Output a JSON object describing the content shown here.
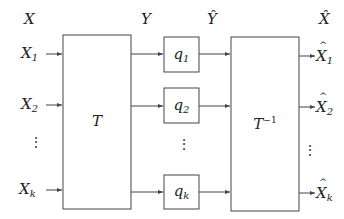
{
  "diagram": {
    "type": "block-diagram",
    "column_headers": {
      "input": "X",
      "transform_output": "Y",
      "quantized": "Ŷ",
      "output": "X̂"
    },
    "inputs": [
      {
        "base": "X",
        "sub": "1"
      },
      {
        "base": "X",
        "sub": "2"
      },
      {
        "base": "X",
        "sub": "k"
      }
    ],
    "transform_block": {
      "label": "T"
    },
    "quantizers": [
      {
        "base": "q",
        "sub": "1"
      },
      {
        "base": "q",
        "sub": "2"
      },
      {
        "base": "q",
        "sub": "k"
      }
    ],
    "inverse_transform_block": {
      "base": "T",
      "sup": "−1"
    },
    "outputs": [
      {
        "base": "X",
        "sub": "1"
      },
      {
        "base": "X",
        "sub": "2"
      },
      {
        "base": "X",
        "sub": "k"
      }
    ],
    "ellipsis": "⋮",
    "colors": {
      "line": "#444444",
      "background": "#ffffff"
    }
  }
}
